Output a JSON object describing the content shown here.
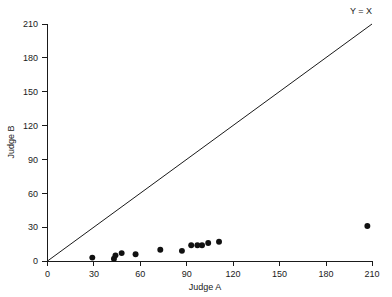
{
  "chart_data": {
    "type": "scatter",
    "title": "",
    "xlabel": "Judge A",
    "ylabel": "Judge B",
    "xlim": [
      0,
      210
    ],
    "ylim": [
      0,
      210
    ],
    "xticks": [
      0,
      30,
      60,
      90,
      120,
      150,
      180,
      210
    ],
    "yticks": [
      0,
      30,
      60,
      90,
      120,
      150,
      180,
      210
    ],
    "xtick_labels": [
      "0",
      "30",
      "60",
      "90",
      "120",
      "150",
      "180",
      "210"
    ],
    "ytick_labels": [
      "0",
      "30",
      "60",
      "90",
      "120",
      "150",
      "180",
      "210"
    ],
    "grid": false,
    "legend": "none",
    "marker": "filled-circle",
    "marker_color": "#111111",
    "marker_size": 4,
    "series": [
      {
        "name": "Judge A vs Judge B",
        "points": [
          [
            29,
            3
          ],
          [
            43,
            2
          ],
          [
            44,
            5
          ],
          [
            48,
            7
          ],
          [
            57,
            6
          ],
          [
            73,
            10
          ],
          [
            87,
            9
          ],
          [
            93,
            14
          ],
          [
            97,
            14
          ],
          [
            100,
            14
          ],
          [
            104,
            16
          ],
          [
            111,
            17
          ],
          [
            207,
            31
          ]
        ]
      }
    ],
    "annotations": [
      {
        "name": "identity-line",
        "type": "line",
        "label": "Y = X",
        "from": [
          0,
          0
        ],
        "to": [
          210,
          210
        ],
        "color": "#1a1a1a"
      }
    ]
  },
  "axes": {
    "x_title": "Judge A",
    "y_title": "Judge B"
  },
  "annotation": {
    "identity_label": "Y = X"
  }
}
